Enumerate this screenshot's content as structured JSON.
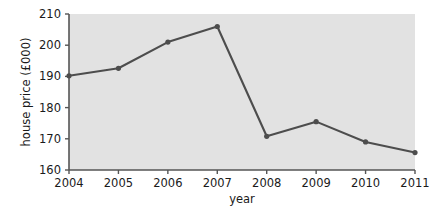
{
  "chart_data": {
    "type": "line",
    "title": "",
    "xlabel": "year",
    "ylabel": "house price (£000)",
    "categories": [
      "2004",
      "2005",
      "2006",
      "2007",
      "2008",
      "2009",
      "2010",
      "2011"
    ],
    "x": [
      2004,
      2005,
      2006,
      2007,
      2008,
      2009,
      2010,
      2011
    ],
    "values": [
      190.2,
      192.6,
      201.0,
      206.0,
      170.8,
      175.5,
      169.0,
      165.6
    ],
    "series": [
      {
        "name": "house price",
        "values": [
          190.2,
          192.6,
          201.0,
          206.0,
          170.8,
          175.5,
          169.0,
          165.6
        ]
      }
    ],
    "xlim": [
      2004,
      2011
    ],
    "ylim": [
      160,
      210
    ],
    "yticks": [
      160,
      170,
      180,
      190,
      200,
      210
    ],
    "ytick_labels": [
      "160",
      "170",
      "180",
      "190",
      "200",
      "210"
    ],
    "xticks": [
      2004,
      2005,
      2006,
      2007,
      2008,
      2009,
      2010,
      2011
    ],
    "xtick_labels": [
      "2004",
      "2005",
      "2006",
      "2007",
      "2008",
      "2009",
      "2010",
      "2011"
    ],
    "grid": false,
    "legend": false,
    "legend_position": "none",
    "colors": {
      "line": "#4d4d4d",
      "marker": "#4d4d4d",
      "plot_background": "#e2e2e2",
      "figure_background": "#ffffff",
      "axis": "#555555",
      "text": "#1a1a1a"
    },
    "marker": "circle",
    "annotations": []
  },
  "axes": {
    "y_title": "house price (£000)",
    "x_title": "year"
  }
}
